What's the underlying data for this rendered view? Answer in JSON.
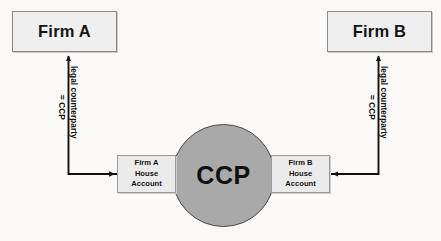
{
  "diagram": {
    "background_color": "#fbfaf8",
    "nodes": {
      "firm_a": {
        "label": "Firm A",
        "fill": "#efefef",
        "border": "#8a8a8a"
      },
      "firm_b": {
        "label": "Firm B",
        "fill": "#efefef",
        "border": "#8a8a8a"
      },
      "ccp": {
        "label": "CCP",
        "fill": "#a9a9a9",
        "border": "#4a4a4a",
        "shape": "circle"
      },
      "house_a": {
        "line1": "Firm A",
        "line2": "House",
        "line3": "Account",
        "fill": "#ebebeb",
        "border": "#9a9a9a"
      },
      "house_b": {
        "line1": "Firm B",
        "line2": "House",
        "line3": "Account",
        "fill": "#ebebeb",
        "border": "#9a9a9a"
      }
    },
    "edges": {
      "left": {
        "label_main": "legal counterparty",
        "label_sub": "= CCP",
        "color": "#111111"
      },
      "right": {
        "label_main": "legal counterparty",
        "label_sub": "= CCP",
        "color": "#111111"
      }
    }
  }
}
